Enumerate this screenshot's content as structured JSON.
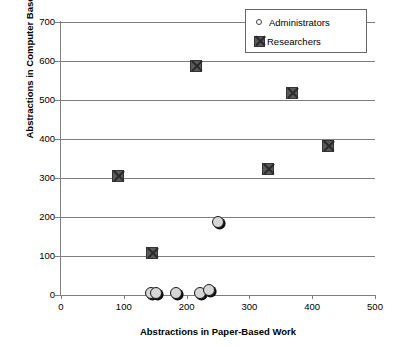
{
  "chart_data": {
    "type": "scatter",
    "title": "",
    "xlabel": "Abstractions in Paper-Based Work",
    "ylabel": "Abstractions in Computer Based Work",
    "xlim": [
      0,
      500
    ],
    "ylim": [
      0,
      700
    ],
    "xticks": [
      0,
      100,
      200,
      300,
      400,
      500
    ],
    "yticks": [
      0,
      100,
      200,
      300,
      400,
      500,
      600,
      700
    ],
    "grid": "horizontal",
    "legend_position": "top-right",
    "series": [
      {
        "name": "Administrators",
        "marker": "circle",
        "color": "#d6d6d6",
        "points": [
          {
            "x": 143,
            "y": 4
          },
          {
            "x": 152,
            "y": 6
          },
          {
            "x": 183,
            "y": 5
          },
          {
            "x": 222,
            "y": 6
          },
          {
            "x": 235,
            "y": 12
          },
          {
            "x": 250,
            "y": 188
          }
        ]
      },
      {
        "name": "Researchers",
        "marker": "square-x",
        "color": "#5a5a5a",
        "points": [
          {
            "x": 91,
            "y": 305
          },
          {
            "x": 145,
            "y": 108
          },
          {
            "x": 215,
            "y": 588
          },
          {
            "x": 330,
            "y": 323
          },
          {
            "x": 368,
            "y": 518
          },
          {
            "x": 425,
            "y": 382
          }
        ]
      }
    ]
  },
  "legend": {
    "items": [
      {
        "label": "Administrators",
        "icon": "circle-marker-icon"
      },
      {
        "label": "Researchers",
        "icon": "square-x-marker-icon"
      }
    ]
  },
  "axes": {
    "y_tick_labels": [
      "700",
      "600",
      "500",
      "400",
      "300",
      "200",
      "100",
      "0"
    ],
    "x_tick_labels": [
      "0",
      "100",
      "200",
      "300",
      "400",
      "500"
    ],
    "y_title": "Abstractions in Computer Based Work",
    "x_title": "Abstractions in Paper-Based Work"
  }
}
